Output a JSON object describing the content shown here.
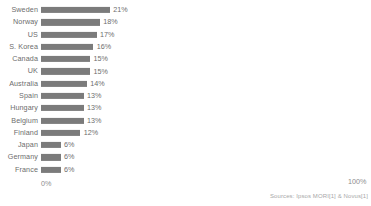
{
  "chart_data": {
    "type": "bar",
    "orientation": "horizontal",
    "title": "",
    "xlabel": "",
    "ylabel": "",
    "xlim": [
      0,
      100
    ],
    "grid": false,
    "legend": false,
    "categories": [
      "Sweden",
      "Norway",
      "US",
      "S. Korea",
      "Canada",
      "UK",
      "Australia",
      "Spain",
      "Hungary",
      "Belgium",
      "Finland",
      "Japan",
      "Germany",
      "France"
    ],
    "values": [
      21,
      18,
      17,
      16,
      15,
      15,
      14,
      13,
      13,
      13,
      12,
      6,
      6,
      6
    ],
    "value_labels": [
      "21%",
      "18%",
      "17%",
      "16%",
      "15%",
      "15%",
      "14%",
      "13%",
      "13%",
      "13%",
      "12%",
      "6%",
      "6%",
      "6%"
    ],
    "bar_color": "#7b7b7b",
    "label_color": "#6d6d6d",
    "axis_color": "#8e8e8e"
  },
  "axis": {
    "min_tick": "0%",
    "max_tick": "100%"
  },
  "footer": {
    "source": "Sources: Ipsos MORI[1] & Novus[1]"
  }
}
